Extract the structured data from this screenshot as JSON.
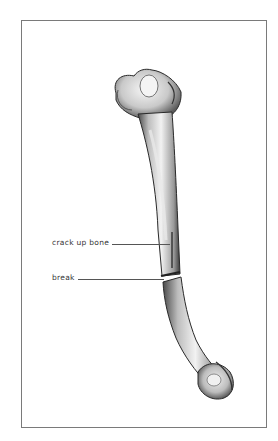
{
  "figure": {
    "subject": "bone",
    "labels": [
      {
        "id": "crack",
        "text": "crack up bone"
      },
      {
        "id": "break",
        "text": "break"
      }
    ],
    "colors": {
      "frame": "#7a7a7a",
      "bone_light": "#efefef",
      "bone_mid": "#c8c8c8",
      "bone_dark": "#3a3a3a",
      "label_text": "#333333"
    }
  }
}
